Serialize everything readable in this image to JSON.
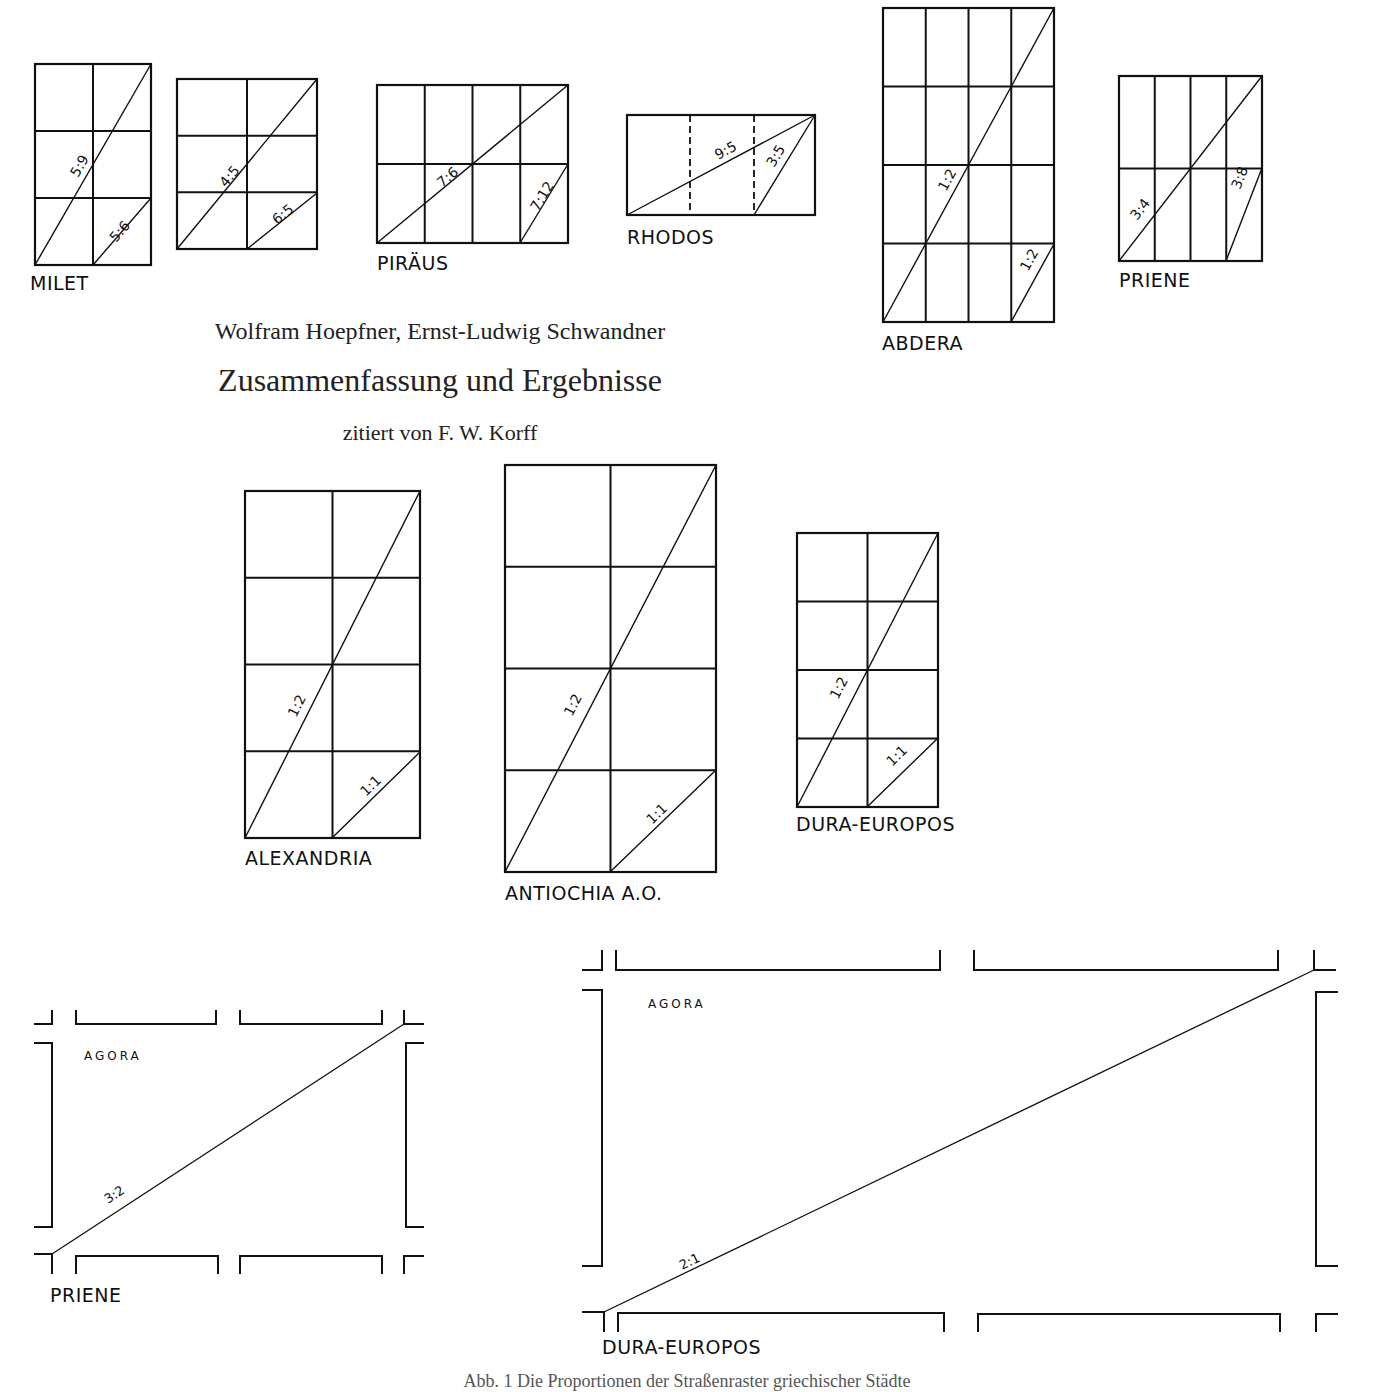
{
  "header": {
    "authors": "Wolfram Hoepfner, Ernst-Ludwig Schwandner",
    "title": "Zusammenfassung und Ergebnisse",
    "subtitle": "zitiert von F. W. Korff"
  },
  "caption": "Abb. 1 Die Proportionen der Straßenraster griechischer Städte",
  "colors": {
    "ink": "#111111",
    "background": "#ffffff"
  },
  "grids": [
    {
      "id": "milet",
      "label": "MILET",
      "x": 35,
      "y": 64,
      "w": 116,
      "h": 201,
      "cols": 2,
      "rows": 3,
      "labelX": 30,
      "labelY": 290,
      "diagonals": [
        {
          "x1": 35,
          "y1": 265,
          "x2": 151,
          "y2": 64,
          "text": "5:9",
          "tx": 78,
          "ty": 178
        },
        {
          "x1": 93,
          "y1": 265,
          "x2": 151,
          "y2": 198,
          "text": "5:6",
          "tx": 116,
          "ty": 243
        }
      ],
      "dashed": []
    },
    {
      "id": "milet-2",
      "label": "",
      "x": 177,
      "y": 79,
      "w": 140,
      "h": 170,
      "cols": 2,
      "rows": 3,
      "labelX": 0,
      "labelY": 0,
      "diagonals": [
        {
          "x1": 177,
          "y1": 249,
          "x2": 317,
          "y2": 79,
          "text": "4:5",
          "tx": 226,
          "ty": 188
        },
        {
          "x1": 247,
          "y1": 249,
          "x2": 317,
          "y2": 193,
          "text": "6:5",
          "tx": 277,
          "ty": 225
        }
      ],
      "dashed": []
    },
    {
      "id": "piraeus",
      "label": "PIRÄUS",
      "x": 377,
      "y": 85,
      "w": 191,
      "h": 158,
      "cols": 4,
      "rows": 2,
      "labelX": 377,
      "labelY": 270,
      "diagonals": [
        {
          "x1": 377,
          "y1": 243,
          "x2": 568,
          "y2": 85,
          "text": "7:6",
          "tx": 442,
          "ty": 188
        },
        {
          "x1": 520,
          "y1": 243,
          "x2": 568,
          "y2": 164,
          "text": "7:12",
          "tx": 538,
          "ty": 212
        }
      ],
      "dashed": []
    },
    {
      "id": "rhodos",
      "label": "RHODOS",
      "x": 627,
      "y": 115,
      "w": 188,
      "h": 100,
      "cols": 1,
      "rows": 1,
      "labelX": 627,
      "labelY": 244,
      "diagonals": [
        {
          "x1": 627,
          "y1": 215,
          "x2": 815,
          "y2": 115,
          "text": "9:5",
          "tx": 718,
          "ty": 160
        },
        {
          "x1": 754,
          "y1": 215,
          "x2": 815,
          "y2": 115,
          "text": "3:5",
          "tx": 774,
          "ty": 168
        }
      ],
      "dashed": [
        {
          "x1": 690,
          "y1": 115,
          "x2": 690,
          "y2": 215
        },
        {
          "x1": 754,
          "y1": 115,
          "x2": 754,
          "y2": 215
        }
      ]
    },
    {
      "id": "abdera",
      "label": "ABDERA",
      "x": 883,
      "y": 8,
      "w": 171,
      "h": 314,
      "cols": 4,
      "rows": 4,
      "labelX": 882,
      "labelY": 350,
      "diagonals": [
        {
          "x1": 883,
          "y1": 322,
          "x2": 1054,
          "y2": 8,
          "text": "1:2",
          "tx": 946,
          "ty": 192
        },
        {
          "x1": 1011,
          "y1": 322,
          "x2": 1054,
          "y2": 244,
          "text": "1:2",
          "tx": 1028,
          "ty": 272
        }
      ],
      "dashed": []
    },
    {
      "id": "priene",
      "label": "PRIENE",
      "x": 1119,
      "y": 76,
      "w": 143,
      "h": 185,
      "cols": 4,
      "rows": 2,
      "labelX": 1119,
      "labelY": 287,
      "diagonals": [
        {
          "x1": 1119,
          "y1": 261,
          "x2": 1262,
          "y2": 76,
          "text": "3:4",
          "tx": 1137,
          "ty": 221
        },
        {
          "x1": 1226,
          "y1": 261,
          "x2": 1262,
          "y2": 168,
          "text": "3:8",
          "tx": 1240,
          "ty": 190
        }
      ],
      "dashed": []
    },
    {
      "id": "alexandria",
      "label": "ALEXANDRIA",
      "x": 245,
      "y": 491,
      "w": 175,
      "h": 347,
      "cols": 2,
      "rows": 4,
      "labelX": 245,
      "labelY": 865,
      "diagonals": [
        {
          "x1": 245,
          "y1": 838,
          "x2": 420,
          "y2": 491,
          "text": "1:2",
          "tx": 296,
          "ty": 718
        },
        {
          "x1": 332,
          "y1": 838,
          "x2": 420,
          "y2": 752,
          "text": "1:1",
          "tx": 366,
          "ty": 797
        }
      ],
      "dashed": []
    },
    {
      "id": "antiochia",
      "label": "ANTIOCHIA A.O.",
      "x": 505,
      "y": 465,
      "w": 211,
      "h": 407,
      "cols": 2,
      "rows": 4,
      "labelX": 505,
      "labelY": 900,
      "diagonals": [
        {
          "x1": 505,
          "y1": 872,
          "x2": 716,
          "y2": 465,
          "text": "1:2",
          "tx": 572,
          "ty": 717
        },
        {
          "x1": 610,
          "y1": 872,
          "x2": 716,
          "y2": 770,
          "text": "1:1",
          "tx": 652,
          "ty": 825
        }
      ],
      "dashed": []
    },
    {
      "id": "dura-europos",
      "label": "DURA-EUROPOS",
      "x": 797,
      "y": 533,
      "w": 141,
      "h": 274,
      "cols": 2,
      "rows": 4,
      "labelX": 796,
      "labelY": 831,
      "diagonals": [
        {
          "x1": 797,
          "y1": 807,
          "x2": 938,
          "y2": 533,
          "text": "1:2",
          "tx": 838,
          "ty": 700
        },
        {
          "x1": 867,
          "y1": 807,
          "x2": 938,
          "y2": 738,
          "text": "1:1",
          "tx": 892,
          "ty": 767
        }
      ],
      "dashed": []
    }
  ],
  "agoras": [
    {
      "id": "agora-priene",
      "label": "PRIENE",
      "agora_label": "AGORA",
      "ratio": "3:2",
      "labelX": 50,
      "labelY": 1302,
      "agoraX": 84,
      "agoraY": 1060,
      "ratioX": 108,
      "ratioY": 1204,
      "diag": {
        "x1": 52,
        "y1": 1254,
        "x2": 404,
        "y2": 1024
      },
      "paths": [
        "M34 1024 L52 1024 L52 1010",
        "M76 1010 L76 1024 L216 1024 L216 1010",
        "M240 1010 L240 1024 L382 1024 L382 1010",
        "M404 1010 L404 1024 L424 1024",
        "M34 1043 L52 1043 L52 1227 L34 1227",
        "M424 1043 L406 1043 L406 1227 L424 1227",
        "M34 1254 L52 1254 L52 1274",
        "M76 1274 L76 1256 L218 1256 L218 1274",
        "M240 1274 L240 1256 L382 1256 L382 1274",
        "M404 1274 L404 1256 L424 1256"
      ]
    },
    {
      "id": "agora-dura",
      "label": "DURA-EUROPOS",
      "agora_label": "AGORA",
      "ratio": "2:1",
      "labelX": 602,
      "labelY": 1354,
      "agoraX": 648,
      "agoraY": 1008,
      "ratioX": 682,
      "ratioY": 1270,
      "diag": {
        "x1": 604,
        "y1": 1312,
        "x2": 1314,
        "y2": 970
      },
      "paths": [
        "M582 970 L602 970 L602 950",
        "M616 950 L616 970 L940 970 L940 950",
        "M974 950 L974 970 L1278 970 L1278 950",
        "M1314 950 L1314 970 L1336 970",
        "M582 990 L602 990 L602 1266 L582 1266",
        "M1338 992 L1316 992 L1316 1266 L1338 1266",
        "M582 1312 L604 1312 L604 1332",
        "M618 1332 L618 1313 L944 1313 L944 1332",
        "M978 1332 L978 1314 L1280 1314 L1280 1332",
        "M1316 1332 L1316 1314 L1338 1314"
      ]
    }
  ]
}
